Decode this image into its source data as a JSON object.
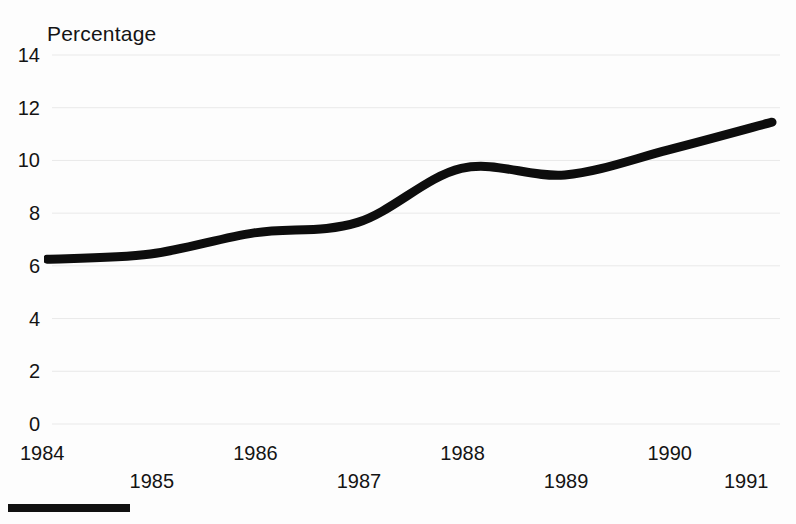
{
  "chart_data": {
    "type": "line",
    "title": "Percentage",
    "xlabel": "",
    "ylabel": "Percentage",
    "x": [
      1984,
      1985,
      1986,
      1987,
      1988,
      1989,
      1990,
      1991
    ],
    "categories": [
      "1984",
      "1985",
      "1986",
      "1987",
      "1988",
      "1989",
      "1990",
      "1991"
    ],
    "values": [
      6.25,
      6.45,
      7.25,
      7.65,
      9.7,
      9.45,
      10.4,
      11.45
    ],
    "series": [
      {
        "name": "Percentage",
        "values": [
          6.25,
          6.45,
          7.25,
          7.65,
          9.7,
          9.45,
          10.4,
          11.45
        ]
      }
    ],
    "xlim": [
      1984,
      1991
    ],
    "ylim": [
      0,
      14
    ],
    "ytick_values": [
      0,
      2,
      4,
      6,
      8,
      10,
      12,
      14
    ],
    "ytick_labels": [
      "0",
      "2",
      "4",
      "6",
      "8",
      "10",
      "12",
      "14"
    ],
    "xtick_labels": [
      "1984",
      "1985",
      "1986",
      "1987",
      "1988",
      "1989",
      "1990",
      "1991"
    ],
    "grid": true,
    "legend": "none",
    "line_color": "#0d0d0d",
    "background_color": "#ffffff",
    "annotations": []
  },
  "title": {
    "text": "Percentage"
  },
  "y_axis": {
    "ticks": [
      {
        "label": "14",
        "value": 14
      },
      {
        "label": "12",
        "value": 12
      },
      {
        "label": "10",
        "value": 10
      },
      {
        "label": "8",
        "value": 8
      },
      {
        "label": "6",
        "value": 6
      },
      {
        "label": "4",
        "value": 4
      },
      {
        "label": "2",
        "value": 2
      },
      {
        "label": "0",
        "value": 0
      }
    ]
  },
  "x_axis": {
    "ticks": [
      {
        "label": "1984",
        "value": 1984,
        "row": 0
      },
      {
        "label": "1985",
        "value": 1985,
        "row": 1
      },
      {
        "label": "1986",
        "value": 1986,
        "row": 0
      },
      {
        "label": "1987",
        "value": 1987,
        "row": 1
      },
      {
        "label": "1988",
        "value": 1988,
        "row": 0
      },
      {
        "label": "1989",
        "value": 1989,
        "row": 1
      },
      {
        "label": "1990",
        "value": 1990,
        "row": 0
      },
      {
        "label": "1991",
        "value": 1991,
        "row": 1
      }
    ]
  },
  "footer": {
    "rule_color": "#111111"
  }
}
